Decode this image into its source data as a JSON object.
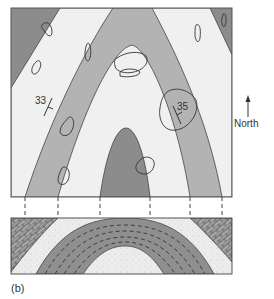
{
  "figure": {
    "panel_label": "(b)",
    "north_label": "North",
    "dip_labels": [
      {
        "value": "33",
        "x": 37,
        "y": 102
      },
      {
        "value": "35",
        "x": 178,
        "y": 107
      }
    ]
  },
  "colors": {
    "dark_unit": "#8c8c8c",
    "gray_unit": "#b3b3b3",
    "light_unit": "#f0f0f0",
    "sandstone": "#ececec",
    "limestone": "#a8a8a8",
    "line": "#444444"
  },
  "map": {
    "units": [
      "outer dark unit",
      "light unit",
      "gray unit",
      "light core unit",
      "dark core unit"
    ],
    "outcrops": 9
  },
  "cross_section": {
    "layers": [
      "limestone",
      "sandstone",
      "shale (dashed)",
      "sandstone core"
    ],
    "projection_lines_x": [
      25,
      58,
      100,
      150,
      190,
      222
    ]
  }
}
